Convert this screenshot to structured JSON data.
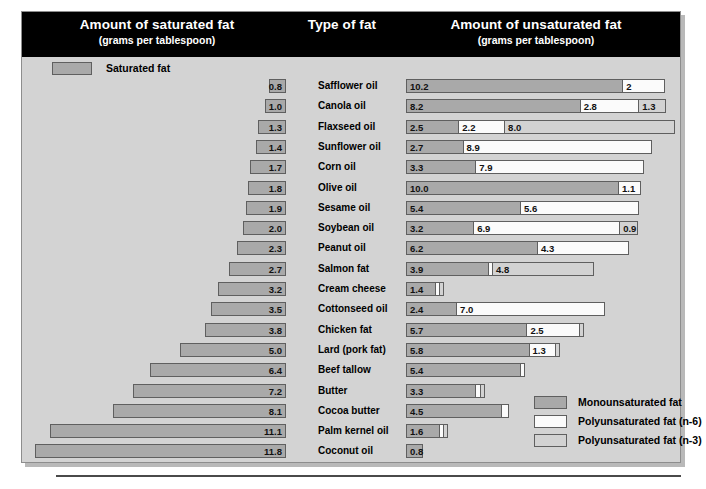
{
  "header": {
    "saturated_title": "Amount of saturated fat",
    "saturated_sub": "(grams per tablespoon)",
    "type_title": "Type of fat",
    "unsaturated_title": "Amount of unsaturated fat",
    "unsaturated_sub": "(grams per tablespoon)"
  },
  "saturated_legend": {
    "label": "Saturated fat",
    "color": "#a9a9a9"
  },
  "legend": {
    "items": [
      {
        "label": "Monounsaturated fat",
        "color": "#a9a9a9",
        "key": "mono"
      },
      {
        "label": "Polyunsaturated fat (n-6)",
        "color": "#fbfbfb",
        "key": "n6"
      },
      {
        "label": "Polyunsaturated fat (n-3)",
        "color": "#d2d2d2",
        "key": "n3"
      }
    ]
  },
  "chart_data": {
    "type": "bar",
    "subtitle": "grams per tablespoon",
    "orientation": "horizontal",
    "layout": "diverging-bidirectional",
    "xlabel_left": "Amount of saturated fat (grams per tablespoon)",
    "xlabel_right": "Amount of unsaturated fat (grams per tablespoon)",
    "grid": false,
    "legend_position": "bottom-right",
    "units": "grams per tablespoon",
    "categories": [
      "Safflower oil",
      "Canola oil",
      "Flaxseed oil",
      "Sunflower oil",
      "Corn oil",
      "Olive oil",
      "Sesame oil",
      "Soybean oil",
      "Peanut oil",
      "Salmon fat",
      "Cream cheese",
      "Cottonseed oil",
      "Chicken fat",
      "Lard (pork fat)",
      "Beef tallow",
      "Butter",
      "Cocoa butter",
      "Palm kernel oil",
      "Coconut oil"
    ],
    "series": [
      {
        "name": "Saturated fat",
        "color": "#a9a9a9",
        "side": "left",
        "values": [
          0.8,
          1.0,
          1.3,
          1.4,
          1.7,
          1.8,
          1.9,
          2.0,
          2.3,
          2.7,
          3.2,
          3.5,
          3.8,
          5.0,
          6.4,
          7.2,
          8.1,
          11.1,
          11.8
        ],
        "labels": [
          "0.8",
          "1.0",
          "1.3",
          "1.4",
          "1.7",
          "1.8",
          "1.9",
          "2.0",
          "2.3",
          "2.7",
          "3.2",
          "3.5",
          "3.8",
          "5.0",
          "6.4",
          "7.2",
          "8.1",
          "11.1",
          "11.8"
        ]
      },
      {
        "name": "Monounsaturated fat",
        "color": "#a9a9a9",
        "side": "right",
        "values": [
          10.2,
          8.2,
          2.5,
          2.7,
          3.3,
          10.0,
          5.4,
          3.2,
          6.2,
          3.9,
          1.4,
          2.4,
          5.7,
          5.8,
          5.4,
          3.3,
          4.5,
          1.6,
          0.8
        ],
        "labels": [
          "10.2",
          "8.2",
          "2.5",
          "2.7",
          "3.3",
          "10.0",
          "5.4",
          "3.2",
          "6.2",
          "3.9",
          "1.4",
          "2.4",
          "5.7",
          "5.8",
          "5.4",
          "3.3",
          "4.5",
          "1.6",
          "0.8"
        ]
      },
      {
        "name": "Polyunsaturated fat (n-6)",
        "color": "#fbfbfb",
        "side": "right",
        "values": [
          2.0,
          2.8,
          2.2,
          8.9,
          7.9,
          1.1,
          5.6,
          6.9,
          4.3,
          0.15,
          0.2,
          7.0,
          2.5,
          1.3,
          0.25,
          0.25,
          0.4,
          0.2,
          0.0
        ],
        "labels": [
          "2",
          "2.8",
          "2.2",
          "8.9",
          "7.9",
          "1.1",
          "5.6",
          "6.9",
          "4.3",
          "",
          "",
          "7.0",
          "2.5",
          "1.3",
          "",
          "",
          "",
          "",
          ""
        ]
      },
      {
        "name": "Polyunsaturated fat (n-3)",
        "color": "#d2d2d2",
        "side": "right",
        "values": [
          0.0,
          1.3,
          8.0,
          0.0,
          0.0,
          0.0,
          0.0,
          0.9,
          0.0,
          4.8,
          0.1,
          0.0,
          0.2,
          0.2,
          0.0,
          0.1,
          0.0,
          0.1,
          0.0
        ],
        "labels": [
          "",
          "1.3",
          "8.0",
          "",
          "",
          "",
          "",
          "0.9",
          "",
          "4.8",
          "",
          "",
          "",
          "",
          "",
          "",
          "",
          "",
          ""
        ]
      }
    ]
  }
}
